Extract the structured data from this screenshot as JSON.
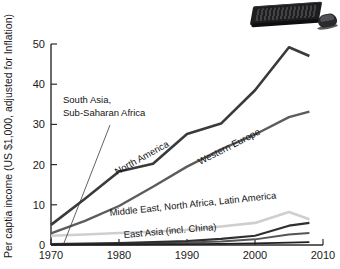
{
  "figure": {
    "photo": {
      "name": "keyboard-and-mouse-photo",
      "alt_text": "Black computer keyboard and wireless mouse"
    }
  },
  "chart_data": {
    "type": "line",
    "title": "",
    "subtitle": "",
    "xlabel": "",
    "ylabel": "Per captia income (US $1,000, adjusted for Inflation)",
    "xlim": [
      1970,
      2010
    ],
    "ylim": [
      0,
      50
    ],
    "x_ticks": [
      "1970",
      "1980",
      "1990",
      "2000",
      "2010"
    ],
    "x_tick_values": [
      1970,
      1980,
      1990,
      2000,
      2010
    ],
    "y_ticks": [
      "0",
      "10",
      "20",
      "30",
      "40",
      "50"
    ],
    "y_tick_values": [
      0,
      10,
      20,
      30,
      40,
      50
    ],
    "grid": false,
    "legend": "inline-annotations",
    "series": [
      {
        "name": "North America",
        "label": "North America",
        "color": "#3a3a3a",
        "width": 2.6,
        "x": [
          1970,
          1975,
          1980,
          1985,
          1990,
          1995,
          2000,
          2005,
          2008
        ],
        "values": [
          5.0,
          11.5,
          18.3,
          20.2,
          27.6,
          30.2,
          38.5,
          49.2,
          47.0
        ]
      },
      {
        "name": "Western Europe",
        "label": "Western Europe",
        "color": "#5c5c5c",
        "width": 2.4,
        "x": [
          1970,
          1975,
          1980,
          1985,
          1990,
          1995,
          2000,
          2005,
          2008
        ],
        "values": [
          2.9,
          6.0,
          9.7,
          14.5,
          19.5,
          23.8,
          27.5,
          31.8,
          33.2
        ]
      },
      {
        "name": "Middle East, North Africa, Latin America",
        "label": "Middle East, North Africa, Latin America",
        "color": "#cfcfcf",
        "width": 2.6,
        "x": [
          1970,
          1975,
          1980,
          1985,
          1990,
          1995,
          2000,
          2005,
          2008
        ],
        "values": [
          2.3,
          2.6,
          3.0,
          3.3,
          3.8,
          4.6,
          5.5,
          8.2,
          6.4
        ]
      },
      {
        "name": "East Asia (incl. China)",
        "label": "East Asia (incl. China)",
        "color": "#2f2f2f",
        "width": 2.2,
        "x": [
          1970,
          1975,
          1980,
          1985,
          1990,
          1995,
          2000,
          2005,
          2008
        ],
        "values": [
          0.25,
          0.35,
          0.5,
          0.7,
          1.0,
          1.5,
          2.3,
          4.8,
          5.5
        ]
      },
      {
        "name": "East Asia lower band",
        "label": "",
        "color": "#555555",
        "width": 2.0,
        "x": [
          1970,
          1975,
          1980,
          1985,
          1990,
          1995,
          2000,
          2005,
          2008
        ],
        "values": [
          0.15,
          0.2,
          0.3,
          0.4,
          0.6,
          0.9,
          1.4,
          2.6,
          3.0
        ]
      },
      {
        "name": "South Asia, Sub-Saharan Africa",
        "label": "South Asia, Sub-Saharan Africa",
        "color": "#1f1f1f",
        "width": 1.8,
        "x": [
          1970,
          1975,
          1980,
          1985,
          1990,
          1995,
          2000,
          2005,
          2008
        ],
        "values": [
          0.05,
          0.08,
          0.12,
          0.16,
          0.22,
          0.3,
          0.42,
          0.6,
          0.7
        ]
      }
    ],
    "annotations": [
      {
        "name": "south-asia-sub-saharan-africa-label",
        "line1": "South Asia,",
        "line2": "Sub-Saharan Africa",
        "leader": true
      },
      {
        "name": "north-america-label",
        "text": "North America",
        "rotation": -29
      },
      {
        "name": "western-europe-label",
        "text": "Western Europe",
        "rotation": -27
      },
      {
        "name": "middle-east-label",
        "text": "Middle East, North Africa, Latin America",
        "rotation": -6
      },
      {
        "name": "east-asia-label",
        "text": "East Asia (incl. China)",
        "rotation": -5
      }
    ]
  }
}
